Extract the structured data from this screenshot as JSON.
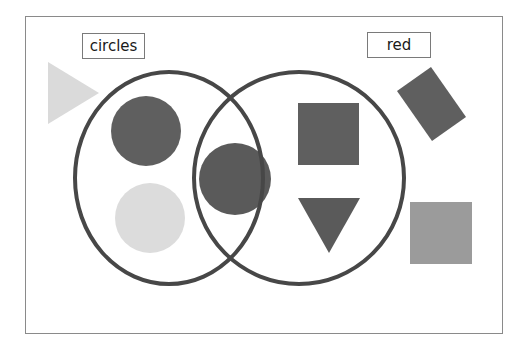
{
  "diagram": {
    "type": "venn",
    "sets": [
      {
        "id": "circles",
        "label": "circles"
      },
      {
        "id": "red",
        "label": "red"
      }
    ],
    "colors": {
      "frame": "#8a8a8a",
      "ring": "#474747",
      "red_shape": "#5f5f5f",
      "light_shape": "#d9d9d9",
      "medium_shape": "#9a9a9a",
      "label_border": "#7a7a7a"
    },
    "shapes": [
      {
        "name": "triangle-light",
        "kind": "triangle-right",
        "fill": "light",
        "region": "outside"
      },
      {
        "name": "circle-red-left",
        "kind": "circle",
        "fill": "red",
        "region": "circles-only"
      },
      {
        "name": "circle-light-left",
        "kind": "circle",
        "fill": "light",
        "region": "circles-only"
      },
      {
        "name": "circle-red-center",
        "kind": "circle",
        "fill": "red",
        "region": "both"
      },
      {
        "name": "square-red",
        "kind": "square",
        "fill": "red",
        "region": "red-only"
      },
      {
        "name": "triangle-red-down",
        "kind": "triangle-down",
        "fill": "red",
        "region": "red-only"
      },
      {
        "name": "rectangle-red-rotated",
        "kind": "rectangle",
        "fill": "red",
        "region": "outside"
      },
      {
        "name": "square-gray",
        "kind": "square",
        "fill": "medium",
        "region": "outside"
      }
    ]
  }
}
